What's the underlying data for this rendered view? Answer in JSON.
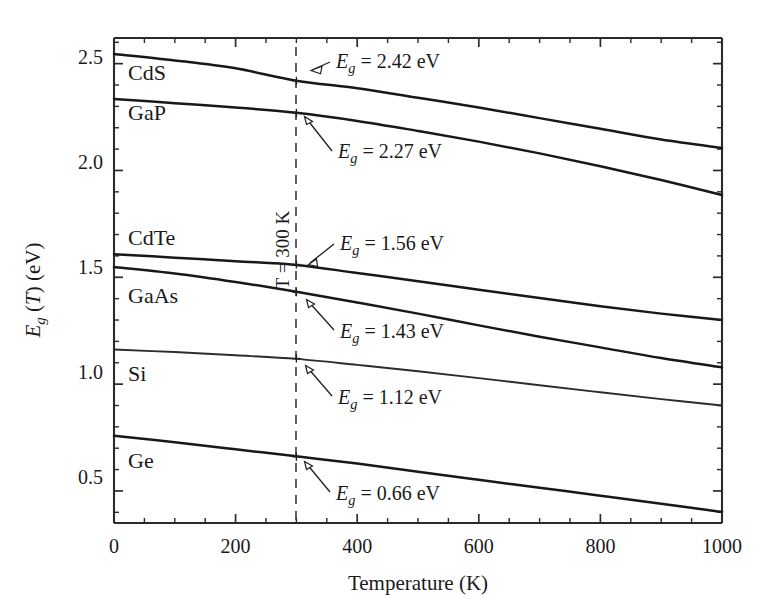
{
  "chart_data": {
    "type": "line",
    "title": "",
    "xlabel": "Temperature (K)",
    "ylabel": "E_g (T) (eV)",
    "xlim": [
      0,
      1000
    ],
    "ylim": [
      0.35,
      2.62
    ],
    "xticks": [
      0,
      200,
      400,
      600,
      800,
      1000
    ],
    "xticklabels": [
      "0",
      "200",
      "400",
      "600",
      "800",
      "1000"
    ],
    "yticks": [
      0.5,
      1.0,
      1.5,
      2.0,
      2.5
    ],
    "yticklabels": [
      "0.5",
      "1.0",
      "1.5",
      "2.0",
      "2.5"
    ],
    "x_minor_step": 50,
    "y_minor_step": 0.1,
    "grid": false,
    "legend": "none (inline series labels)",
    "reference_line": {
      "axis": "x",
      "value": 300,
      "label": "T = 300 K",
      "style": "dashed",
      "orientation": "vertical"
    },
    "series": [
      {
        "name": "CdS",
        "label_x": 60,
        "label_y": 2.42,
        "value_at_300K": 2.42,
        "annotation": "E_g = 2.42 eV",
        "x": [
          0,
          100,
          200,
          300,
          400,
          500,
          600,
          700,
          800,
          900,
          1000
        ],
        "y": [
          2.545,
          2.515,
          2.478,
          2.42,
          2.385,
          2.34,
          2.295,
          2.245,
          2.195,
          2.145,
          2.105
        ]
      },
      {
        "name": "GaP",
        "label_x": 60,
        "label_y": 2.25,
        "value_at_300K": 2.27,
        "annotation": "E_g = 2.27 eV",
        "x": [
          0,
          100,
          200,
          300,
          400,
          500,
          600,
          700,
          800,
          900,
          1000
        ],
        "y": [
          2.335,
          2.315,
          2.295,
          2.27,
          2.232,
          2.185,
          2.135,
          2.08,
          2.02,
          1.955,
          1.885
        ]
      },
      {
        "name": "CdTe",
        "label_x": 60,
        "label_y": 1.66,
        "value_at_300K": 1.56,
        "annotation": "E_g = 1.56 eV",
        "x": [
          0,
          100,
          200,
          300,
          400,
          500,
          600,
          700,
          800,
          900,
          1000
        ],
        "y": [
          1.608,
          1.592,
          1.575,
          1.558,
          1.52,
          1.482,
          1.442,
          1.403,
          1.365,
          1.33,
          1.3
        ]
      },
      {
        "name": "GaAs",
        "label_x": 60,
        "label_y": 1.44,
        "value_at_300K": 1.43,
        "annotation": "E_g = 1.43 eV",
        "x": [
          0,
          100,
          200,
          300,
          400,
          500,
          600,
          700,
          800,
          900,
          1000
        ],
        "y": [
          1.548,
          1.518,
          1.478,
          1.432,
          1.382,
          1.33,
          1.275,
          1.222,
          1.172,
          1.122,
          1.078
        ]
      },
      {
        "name": "Si",
        "label_x": 60,
        "label_y": 1.07,
        "value_at_300K": 1.12,
        "annotation": "E_g = 1.12 eV",
        "x": [
          0,
          100,
          200,
          300,
          400,
          500,
          600,
          700,
          800,
          900,
          1000
        ],
        "y": [
          1.162,
          1.15,
          1.135,
          1.118,
          1.09,
          1.06,
          1.028,
          0.995,
          0.962,
          0.93,
          0.9
        ]
      },
      {
        "name": "Ge",
        "label_x": 60,
        "label_y": 0.655,
        "value_at_300K": 0.66,
        "annotation": "E_g = 0.66 eV",
        "x": [
          0,
          100,
          200,
          300,
          400,
          500,
          600,
          700,
          800,
          900,
          1000
        ],
        "y": [
          0.758,
          0.728,
          0.695,
          0.662,
          0.628,
          0.59,
          0.552,
          0.515,
          0.478,
          0.44,
          0.402
        ]
      }
    ]
  },
  "axes": {
    "x_title": "Temperature (K)",
    "y_title_main": "E",
    "y_title_sub": "g",
    "y_title_rest": " (T) (eV)",
    "x_tick_0": "0",
    "x_tick_1": "200",
    "x_tick_2": "400",
    "x_tick_3": "600",
    "x_tick_4": "800",
    "x_tick_5": "1000",
    "y_tick_0": "0.5",
    "y_tick_1": "1.0",
    "y_tick_2": "1.5",
    "y_tick_3": "2.0",
    "y_tick_4": "2.5"
  },
  "reference": {
    "text": "T = 300 K"
  },
  "series_labels": {
    "cds": "CdS",
    "gap": "GaP",
    "cdte": "CdTe",
    "gaas": "GaAs",
    "si": "Si",
    "ge": "Ge"
  },
  "annotations": {
    "eg_symbol": "E",
    "eg_sub": "g",
    "cds": " = 2.42 eV",
    "gap": " = 2.27 eV",
    "cdte": " = 1.56 eV",
    "gaas": " = 1.43 eV",
    "si": " = 1.12 eV",
    "ge": " = 0.66 eV"
  },
  "colors": {
    "curve": "#16181a",
    "axis": "#2b2b2b",
    "background": "#ffffff",
    "dashed_line": "#3a3a3a"
  }
}
